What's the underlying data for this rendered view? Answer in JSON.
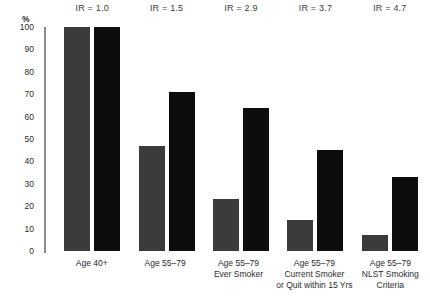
{
  "chart_data": {
    "type": "bar",
    "title": "",
    "xlabel": "",
    "ylabel": "%",
    "ylim": [
      0,
      100
    ],
    "grid": false,
    "legend": "none",
    "ytick_labels": [
      "100",
      "90",
      "80",
      "70",
      "60",
      "50",
      "40",
      "30",
      "20",
      "10",
      "0"
    ],
    "yticks": [
      100,
      90,
      80,
      70,
      60,
      50,
      40,
      30,
      20,
      10,
      0
    ],
    "categories": [
      "Age 40+",
      "Age 55–79",
      "Age 55–79 Ever Smoker",
      "Age 55–79 Current Smoker or Quit within 15 Yrs",
      "Age 55–79 NLST Smoking Criteria"
    ],
    "category_lines": [
      [
        "Age 40+"
      ],
      [
        "Age 55–79"
      ],
      [
        "Age 55–79",
        "Ever Smoker"
      ],
      [
        "Age 55–79",
        "Current Smoker",
        "or Quit within 15 Yrs"
      ],
      [
        "Age 55–79",
        "NLST Smoking",
        "Criteria"
      ]
    ],
    "series": [
      {
        "name": "series-1",
        "color": "#3b3b3b",
        "values": [
          100,
          47,
          23,
          14,
          7
        ]
      },
      {
        "name": "series-2",
        "color": "#0d0d0d",
        "values": [
          100,
          71,
          64,
          45,
          33
        ]
      }
    ],
    "annotations": [
      "IR = 1.0",
      "IR = 1.5",
      "IR = 2.9",
      "IR = 3.7",
      "IR = 4.7"
    ]
  },
  "colors": {
    "series_1": "#3b3b3b",
    "series_2": "#0d0d0d",
    "axis": "#8e8e8e",
    "text": "#2b2b2b",
    "background": "#ffffff"
  }
}
